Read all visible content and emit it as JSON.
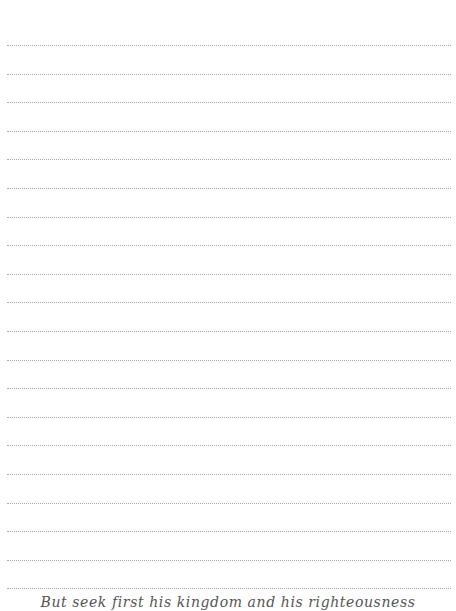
{
  "page": {
    "type": "lined-journal-page",
    "background_color": "#ffffff",
    "rule_color": "#a8a8a8",
    "rule_style": "dotted",
    "rule_count": 20,
    "rule_first_y": 45,
    "rule_spacing": 28.6,
    "rule_left": 7,
    "rule_width": 444
  },
  "caption": {
    "text": "But seek first his kingdom and his righteousness",
    "color": "#555555"
  }
}
